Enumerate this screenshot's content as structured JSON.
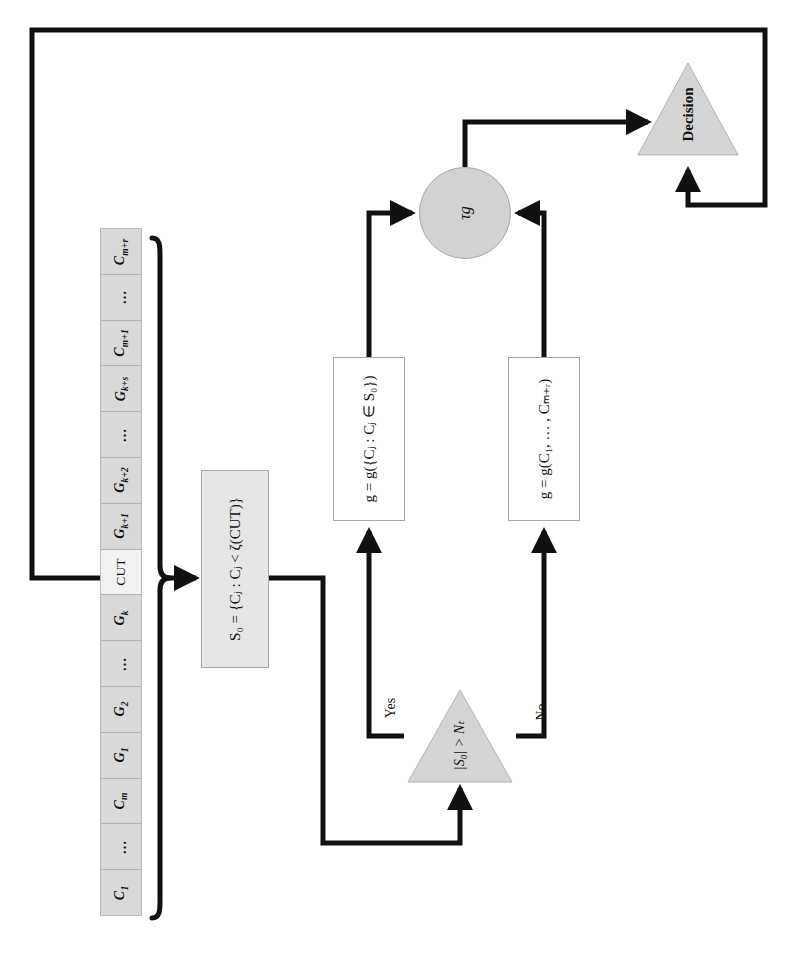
{
  "diagram": {
    "orientation": "rotated-90",
    "colors": {
      "cell_fill": "#d9d9d9",
      "cut_cell_fill": "#f2f2f2",
      "process_fill": "#e6e6e6",
      "white_fill": "#ffffff",
      "node_fill": "#d2d2d2",
      "triangle_fill": "#d4d4d4",
      "stroke": "#111111",
      "thin_border": "#a8a8a8"
    }
  },
  "cell_array": {
    "name": "candidate-sequence",
    "cells": [
      {
        "label": "C",
        "subscript": "m+r",
        "kind": "symbol"
      },
      {
        "label": "…",
        "subscript": "",
        "kind": "ellipsis"
      },
      {
        "label": "C",
        "subscript": "m+1",
        "kind": "symbol"
      },
      {
        "label": "G",
        "subscript": "k+s",
        "kind": "symbol"
      },
      {
        "label": "…",
        "subscript": "",
        "kind": "ellipsis"
      },
      {
        "label": "G",
        "subscript": "k+2",
        "kind": "symbol"
      },
      {
        "label": "G",
        "subscript": "k+1",
        "kind": "symbol"
      },
      {
        "label": "CUT",
        "subscript": "",
        "kind": "cut"
      },
      {
        "label": "G",
        "subscript": "k",
        "kind": "symbol"
      },
      {
        "label": "…",
        "subscript": "",
        "kind": "ellipsis"
      },
      {
        "label": "G",
        "subscript": "2",
        "kind": "symbol"
      },
      {
        "label": "G",
        "subscript": "1",
        "kind": "symbol"
      },
      {
        "label": "C",
        "subscript": "m",
        "kind": "symbol"
      },
      {
        "label": "…",
        "subscript": "",
        "kind": "ellipsis"
      },
      {
        "label": "C",
        "subscript": "1",
        "kind": "symbol"
      }
    ]
  },
  "nodes": {
    "s0_box": {
      "id": "s0-box",
      "text": "S₀ = {Cⱼ : Cⱼ < ζ(CUT)}",
      "shape": "rectangle"
    },
    "g_subset_box": {
      "id": "g-subset-box",
      "text": "g = g({Cⱼ : Cⱼ ∈ S₀})",
      "shape": "rectangle"
    },
    "g_full_box": {
      "id": "g-full-box",
      "text": "g = g(C₁, … , Cₘ₊ᵣ)",
      "shape": "rectangle"
    },
    "tau_node": {
      "id": "tau-node",
      "text": "τg",
      "shape": "circle"
    },
    "test_triangle": {
      "id": "test-triangle",
      "text": "|S₀| > Nₜ",
      "shape": "triangle"
    },
    "decision_triangle": {
      "id": "decision-triangle",
      "text": "Decision",
      "shape": "triangle"
    }
  },
  "branch_labels": {
    "yes": "Yes",
    "no": "No"
  },
  "edges": [
    {
      "from": "cell-array-cut",
      "to": "s0-box",
      "label": ""
    },
    {
      "from": "s0-box",
      "to": "test-triangle",
      "label": ""
    },
    {
      "from": "test-triangle",
      "to": "g-subset-box",
      "label": "Yes"
    },
    {
      "from": "test-triangle",
      "to": "g-full-box",
      "label": "No"
    },
    {
      "from": "g-subset-box",
      "to": "tau-node",
      "label": ""
    },
    {
      "from": "g-full-box",
      "to": "tau-node",
      "label": ""
    },
    {
      "from": "tau-node",
      "to": "decision-triangle",
      "label": ""
    },
    {
      "from": "decision-triangle",
      "to": "cell-array-cut",
      "label": ""
    }
  ]
}
